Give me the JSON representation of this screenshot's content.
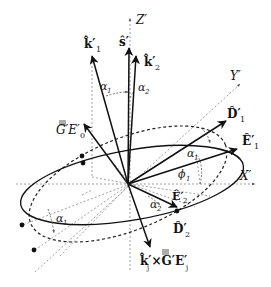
{
  "diagram": {
    "axes": {
      "z_label": "Z′",
      "y_label": "Y′",
      "x_label": "X′"
    },
    "vectors": {
      "k1": {
        "label": "k̂′",
        "sub": "1"
      },
      "s": {
        "label": "ŝ′"
      },
      "k2": {
        "label": "k̂′",
        "sub": "2"
      },
      "G_E0": {
        "label": "G′E′",
        "sub": "0"
      },
      "D1": {
        "label": "D̂′",
        "sub": "1"
      },
      "E1": {
        "label": "Ê′",
        "sub": "1"
      },
      "E2": {
        "label": "Ê′",
        "sub": "2"
      },
      "D2": {
        "label": "D̂′",
        "sub": "2"
      },
      "kj_cross": {
        "label": "k̂′×G′E′",
        "sub_k": "j",
        "sub_e": "j"
      }
    },
    "angles": {
      "alpha1": "α",
      "alpha1_sub": "1",
      "alpha2": "α",
      "alpha2_sub": "2",
      "phi1": "ϕ",
      "phi1_sub": "1"
    },
    "colors": {
      "line": "#111111",
      "dashed": "#777777",
      "background": "#ffffff"
    }
  }
}
